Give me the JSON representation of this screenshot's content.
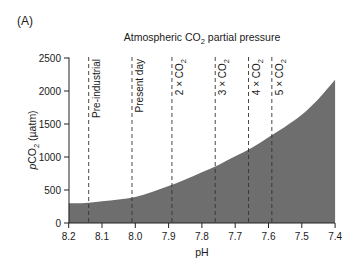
{
  "panel_label": "(A)",
  "chart_data": {
    "type": "area",
    "title": "Atmospheric CO2 partial pressure",
    "title_parts": {
      "pre": "Atmospheric CO",
      "sub": "2",
      "post": " partial pressure"
    },
    "xlabel": "pH",
    "ylabel": "pCO2 (µatm)",
    "ylabel_parts": {
      "italic": "p",
      "pre": "CO",
      "sub": "2",
      "post": " (µatm)"
    },
    "xlim": [
      8.2,
      7.4
    ],
    "ylim": [
      0,
      2500
    ],
    "x_ticks": [
      "8.2",
      "8.1",
      "8.0",
      "7.9",
      "7.8",
      "7.7",
      "7.6",
      "7.5",
      "7.4"
    ],
    "y_ticks": [
      "0",
      "500",
      "1000",
      "1500",
      "2000",
      "2500"
    ],
    "grid": false,
    "fill_color": "#6e6e6e",
    "series": [
      {
        "name": "pCO2 vs pH",
        "x": [
          8.2,
          8.15,
          8.1,
          8.05,
          8.0,
          7.95,
          7.9,
          7.85,
          7.8,
          7.75,
          7.7,
          7.65,
          7.6,
          7.55,
          7.5,
          7.45,
          7.4
        ],
        "values": [
          300,
          302,
          330,
          355,
          395,
          470,
          560,
          660,
          770,
          880,
          1010,
          1140,
          1300,
          1460,
          1640,
          1880,
          2170
        ]
      }
    ],
    "reference_lines": [
      {
        "label": "Pre-industrial",
        "pre": "Pre-industrial",
        "sub": "",
        "ph": 8.14
      },
      {
        "label": "Present day",
        "pre": "Present day",
        "sub": "",
        "ph": 8.01
      },
      {
        "label": "2×CO2",
        "pre": "2 × CO",
        "sub": "2",
        "ph": 7.89
      },
      {
        "label": "3×CO2",
        "pre": "3 × CO",
        "sub": "2",
        "ph": 7.76
      },
      {
        "label": "4×CO2",
        "pre": "4 × CO",
        "sub": "2",
        "ph": 7.66
      },
      {
        "label": "5×CO2",
        "pre": "5 × CO",
        "sub": "2",
        "ph": 7.59
      }
    ]
  }
}
